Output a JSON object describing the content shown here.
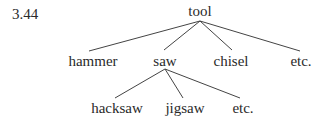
{
  "figure_number": "3.44",
  "tree": {
    "root": "tool",
    "level1": [
      "hammer",
      "saw",
      "chisel",
      "etc."
    ],
    "level2_under_saw": [
      "hacksaw",
      "jigsaw",
      "etc."
    ]
  },
  "colors": {
    "text": "#2a2a2a",
    "lines": "#444444"
  }
}
